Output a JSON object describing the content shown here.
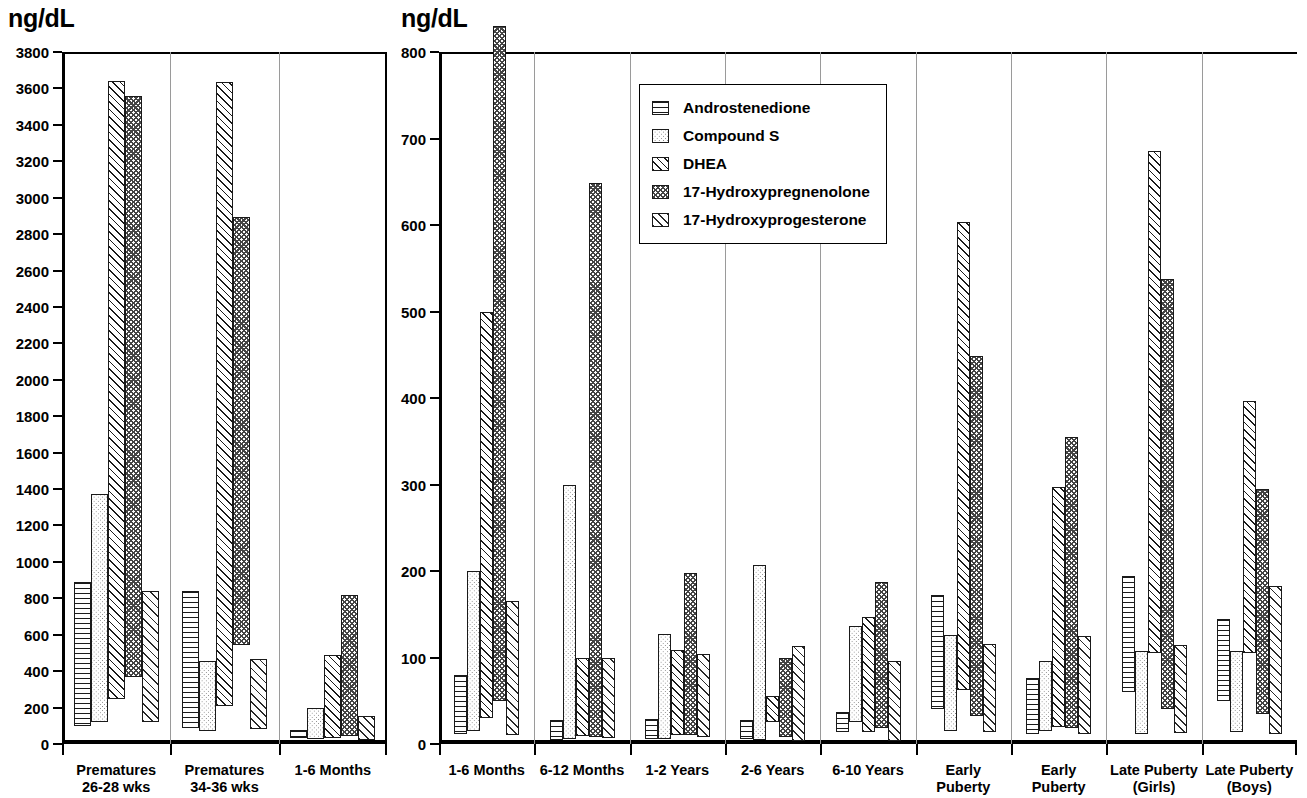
{
  "figure": {
    "unit_label_left": "ng/dL",
    "unit_label_right": "ng/dL"
  },
  "legend": {
    "position": "upper-center-right-panel",
    "entries": [
      {
        "label": "Androstenedione",
        "pattern": "horizontal-lines"
      },
      {
        "label": "Compound S",
        "pattern": "light-dots"
      },
      {
        "label": "DHEA",
        "pattern": "diagonal-hatch"
      },
      {
        "label": "17-Hydroxypregnenolone",
        "pattern": "cross-hatch"
      },
      {
        "label": "17-Hydroxyprogesterone",
        "pattern": "diagonal-hatch-light"
      }
    ]
  },
  "chart_data": [
    {
      "id": "left",
      "type": "bar",
      "subtype": "floating-range-bar",
      "title": "",
      "xlabel": "",
      "ylabel": "ng/dL",
      "ylim": [
        0,
        3800
      ],
      "ytick_step": 200,
      "yticks": [
        0,
        200,
        400,
        600,
        800,
        1000,
        1200,
        1400,
        1600,
        1800,
        2000,
        2200,
        2400,
        2600,
        2800,
        3000,
        3200,
        3400,
        3600,
        3800
      ],
      "grid": false,
      "categories": [
        "Premature 26-28 wks",
        "Premature 34-36 wks",
        "1-6 Months"
      ],
      "category_labels": [
        [
          "Prematures",
          "26-28 wks"
        ],
        [
          "Prematures",
          "34-36 wks"
        ],
        [
          "1-6 Months",
          ""
        ]
      ],
      "series": [
        {
          "name": "Androstenedione",
          "pattern": "horizontal-lines",
          "ranges": [
            [
              100,
              890
            ],
            [
              90,
              840
            ],
            [
              35,
              75
            ]
          ]
        },
        {
          "name": "Compound S",
          "pattern": "light-dots",
          "ranges": [
            [
              120,
              1375
            ],
            [
              70,
              455
            ],
            [
              25,
              195
            ]
          ]
        },
        {
          "name": "DHEA",
          "pattern": "diagonal-hatch",
          "ranges": [
            [
              245,
              3640
            ],
            [
              210,
              3635
            ],
            [
              35,
              490
            ]
          ]
        },
        {
          "name": "17-Hydroxypregnenolone",
          "pattern": "cross-hatch",
          "ranges": [
            [
              370,
              3560
            ],
            [
              545,
              2895
            ],
            [
              45,
              820
            ]
          ]
        },
        {
          "name": "17-Hydroxyprogesterone",
          "pattern": "diagonal-hatch-light",
          "ranges": [
            [
              120,
              840
            ],
            [
              85,
              465
            ],
            [
              20,
              155
            ]
          ]
        }
      ]
    },
    {
      "id": "right",
      "type": "bar",
      "subtype": "floating-range-bar",
      "title": "",
      "xlabel": "",
      "ylabel": "ng/dL",
      "ylim": [
        0,
        800
      ],
      "ytick_step": 100,
      "yticks": [
        0,
        100,
        200,
        300,
        400,
        500,
        600,
        700,
        800
      ],
      "grid": false,
      "categories": [
        "1-6 Months",
        "6-12 Months",
        "1-2 Years",
        "2-6 Years",
        "6-10 Years",
        "Early Puberty",
        "Early Puberty",
        "Late Puberty (Girls)",
        "Late Puberty (Boys)"
      ],
      "category_labels": [
        [
          "1-6 Months",
          ""
        ],
        [
          "6-12 Months",
          ""
        ],
        [
          "1-2 Years",
          ""
        ],
        [
          "2-6 Years",
          ""
        ],
        [
          "6-10 Years",
          ""
        ],
        [
          "Early",
          "Puberty"
        ],
        [
          "Early",
          "Puberty"
        ],
        [
          "Late Puberty",
          "(Girls)"
        ],
        [
          "Late Puberty",
          "(Boys)"
        ]
      ],
      "series": [
        {
          "name": "Androstenedione",
          "pattern": "horizontal-lines",
          "ranges": [
            [
              12,
              80
            ],
            [
              5,
              28
            ],
            [
              6,
              29
            ],
            [
              6,
              28
            ],
            [
              14,
              37
            ],
            [
              40,
              172
            ],
            [
              12,
              76
            ],
            [
              60,
              194
            ],
            [
              50,
              144
            ]
          ]
        },
        {
          "name": "Compound S",
          "pattern": "light-dots",
          "ranges": [
            [
              15,
              200
            ],
            [
              6,
              300
            ],
            [
              6,
              127
            ],
            [
              5,
              207
            ],
            [
              25,
              136
            ],
            [
              15,
              126
            ],
            [
              15,
              96
            ],
            [
              12,
              108
            ],
            [
              14,
              107
            ]
          ]
        },
        {
          "name": "DHEA",
          "pattern": "diagonal-hatch",
          "ranges": [
            [
              30,
              500
            ],
            [
              9,
              99
            ],
            [
              10,
              109
            ],
            [
              25,
              56
            ],
            [
              14,
              147
            ],
            [
              62,
              603
            ],
            [
              20,
              297
            ],
            [
              105,
              685
            ],
            [
              105,
              397
            ]
          ]
        },
        {
          "name": "17-Hydroxypregnenolone",
          "pattern": "cross-hatch",
          "ranges": [
            [
              50,
              830
            ],
            [
              8,
              648
            ],
            [
              10,
              198
            ],
            [
              8,
              99
            ],
            [
              19,
              187
            ],
            [
              32,
              448
            ],
            [
              18,
              355
            ],
            [
              40,
              537
            ],
            [
              35,
              295
            ]
          ]
        },
        {
          "name": "17-Hydroxyprogesterone",
          "pattern": "diagonal-hatch-light",
          "ranges": [
            [
              10,
              165
            ],
            [
              7,
              99
            ],
            [
              8,
              104
            ],
            [
              3,
              113
            ],
            [
              4,
              96
            ],
            [
              14,
              116
            ],
            [
              12,
              125
            ],
            [
              13,
              114
            ],
            [
              11,
              183
            ]
          ]
        }
      ]
    }
  ]
}
